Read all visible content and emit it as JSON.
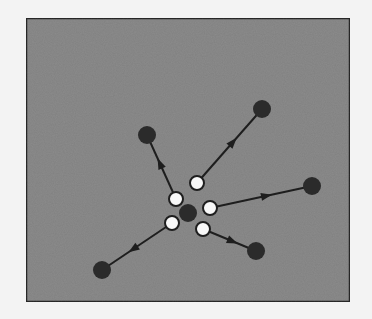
{
  "diagram": {
    "colors": {
      "page_background": "#f3f3f3",
      "field_fill": "#8c8c8c",
      "field_border": "#2a2a2a",
      "dark_particle": "#2b2b2b",
      "white_marker": "#f8f8f8",
      "arrow": "#1e1e1e"
    },
    "frame": {
      "x": 26,
      "y": 18,
      "width": 324,
      "height": 284
    },
    "center": {
      "x": 188,
      "y": 213,
      "r": 9
    },
    "spokes": [
      {
        "name": "upper-left",
        "start": {
          "x": 176,
          "y": 199
        },
        "end": {
          "x": 147,
          "y": 135
        }
      },
      {
        "name": "upper-right",
        "start": {
          "x": 197,
          "y": 183
        },
        "end": {
          "x": 262,
          "y": 109
        }
      },
      {
        "name": "right",
        "start": {
          "x": 210,
          "y": 208
        },
        "end": {
          "x": 312,
          "y": 186
        }
      },
      {
        "name": "lower-right",
        "start": {
          "x": 203,
          "y": 229
        },
        "end": {
          "x": 256,
          "y": 251
        }
      },
      {
        "name": "lower-left",
        "start": {
          "x": 172,
          "y": 223
        },
        "end": {
          "x": 102,
          "y": 270
        }
      }
    ],
    "marker_radius": 7,
    "outer_radius": 9
  }
}
